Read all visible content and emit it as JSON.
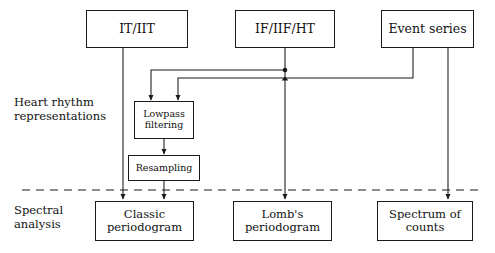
{
  "figure": {
    "type": "flowchart",
    "title": "",
    "background_color": "#ffffff",
    "line_color": "#1a1a1a",
    "text_color": "#111111"
  },
  "row_labels": [
    {
      "text": "Heart rhythm\nrepresentations"
    },
    {
      "text": "Spectral\nanalysis"
    }
  ],
  "nodes": {
    "top": [
      {
        "id": "it_iit",
        "label": "IT/IIT"
      },
      {
        "id": "if_iif_ht",
        "label": "IF/IIF/HT"
      },
      {
        "id": "event_series",
        "label": "Event series"
      }
    ],
    "middle": [
      {
        "id": "lowpass",
        "label": "Lowpass\nfiltering"
      },
      {
        "id": "resampling",
        "label": "Resampling"
      }
    ],
    "bottom": [
      {
        "id": "classic_periodogram",
        "label": "Classic\nperiodogram"
      },
      {
        "id": "lombs_periodogram",
        "label": "Lomb's\nperiodogram"
      },
      {
        "id": "spectrum_of_counts",
        "label": "Spectrum of\ncounts"
      }
    ]
  },
  "separator": {
    "style": "dashed",
    "orientation": "horizontal"
  },
  "edges": [
    {
      "from": "it_iit",
      "to": "classic_periodogram",
      "arrow": true
    },
    {
      "from": "it_iit",
      "to": "lowpass",
      "arrow": true
    },
    {
      "from": "if_iif_ht",
      "to": "lowpass",
      "arrow": true
    },
    {
      "from": "if_iif_ht",
      "to": "lombs_periodogram",
      "arrow": true
    },
    {
      "from": "event_series",
      "to": "lowpass",
      "arrow": true
    },
    {
      "from": "event_series",
      "to": "spectrum_of_counts",
      "arrow": true
    },
    {
      "from": "lowpass",
      "to": "resampling",
      "arrow": true
    },
    {
      "from": "resampling",
      "to": "classic_periodogram",
      "arrow": true
    }
  ]
}
